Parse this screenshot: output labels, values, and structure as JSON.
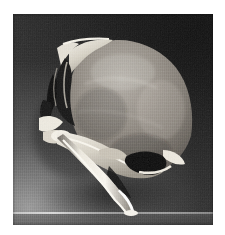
{
  "document": {
    "type": "photograph",
    "title": "Gross specimen photograph",
    "caption": ""
  },
  "page": {
    "background_color": "#ffffff",
    "width_px": 225,
    "height_px": 235
  },
  "photo": {
    "name": "specimen-photograph",
    "alt_text": "Black and white gross pathology photograph of a resected bone specimen showing a large rounded tumour mass attached to a bony base with a long curved bony process descending to the table surface",
    "left_px": 13,
    "top_px": 14,
    "width_px": 200,
    "height_px": 211,
    "color_mode": "grayscale",
    "background": {
      "description": "Dark photographic backdrop, graded from near-black at the upper right to mid grey at the lower left",
      "dark_color": "#161616",
      "mid_color": "#3a3a3a",
      "light_color": "#9a9a9a"
    },
    "surface_line": {
      "name": "table-surface-line",
      "description": "Light horizontal line marking the supporting surface near the bottom of the frame",
      "color": "#e0e0e0",
      "y_px": 198
    },
    "subject": {
      "description": "Resected bone and soft tissue specimen in lateral profile",
      "regions": [
        {
          "name": "tumour-mass",
          "description": "Large rounded lobulated mass occupying the upper right two thirds of the specimen",
          "tone": "mid grey",
          "color": "#8a8480"
        },
        {
          "name": "superior-bone-ridge",
          "description": "Bright irregular bone ridge along the upper left border of the mass",
          "tone": "bright white",
          "color": "#e8e6e0"
        },
        {
          "name": "cavity-upper-left",
          "description": "Dark fissured cavity and sectioned sinus spaces at the upper left of the specimen",
          "tone": "near black",
          "color": "#141414"
        },
        {
          "name": "cavity-lower-right",
          "description": "Dark rounded cavity resembling an orbit or sinus, bordered by bright bone, lower right of the mass",
          "tone": "near black",
          "color": "#111111"
        },
        {
          "name": "bony-base",
          "description": "Irregular bright bone shelf running diagonally below the mass",
          "tone": "bright",
          "color": "#d8d4cc"
        },
        {
          "name": "descending-process",
          "description": "Long slender curved bright bony process descending from the base to the table surface",
          "tone": "bright white",
          "color": "#f0ece4"
        },
        {
          "name": "cast-shadow",
          "description": "Soft dark shadow cast to the lower left of the specimen",
          "tone": "dark grey",
          "color": "#4a4a4a"
        }
      ]
    }
  }
}
